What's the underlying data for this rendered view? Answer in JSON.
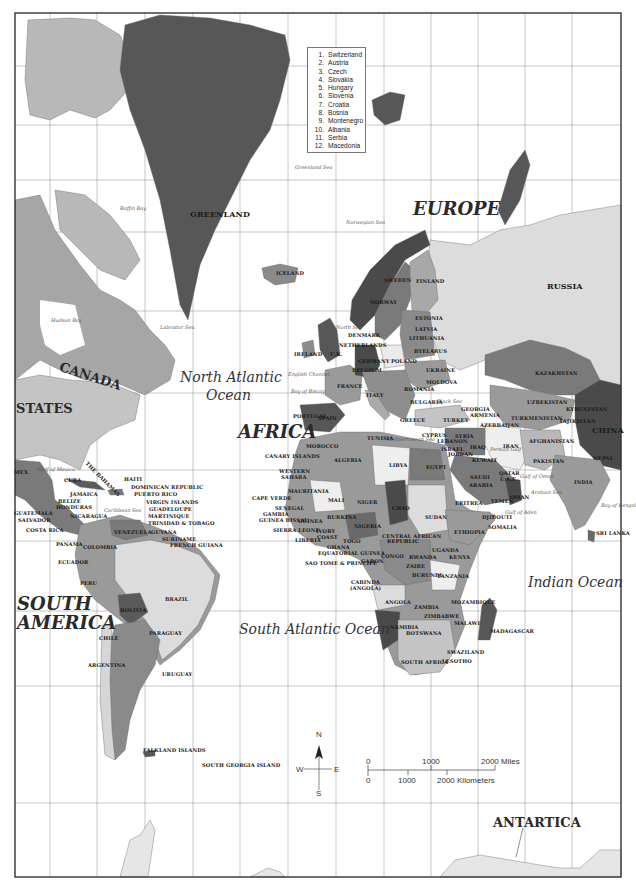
{
  "map": {
    "border": {
      "x": 15,
      "y": 13,
      "w": 606,
      "h": 864
    },
    "grid_x": [
      50,
      97,
      145,
      193,
      240,
      288,
      336,
      384,
      431,
      478,
      525,
      572
    ],
    "grid_y": [
      66,
      125,
      180,
      232,
      311,
      393,
      470,
      541,
      611,
      686,
      803
    ],
    "colors": {
      "dark": "#4a4a4a",
      "mid": "#7a7a7a",
      "midlight": "#9a9a9a",
      "light": "#c4c4c4",
      "pale": "#dcdcdc",
      "grid": "#9e9e9e",
      "border": "#333333"
    }
  },
  "legend": {
    "items": [
      {
        "num": "1.",
        "name": "Switzerland"
      },
      {
        "num": "2.",
        "name": "Austria"
      },
      {
        "num": "3.",
        "name": "Czech"
      },
      {
        "num": "4.",
        "name": "Slovakia"
      },
      {
        "num": "5.",
        "name": "Hungary"
      },
      {
        "num": "6.",
        "name": "Slovenia"
      },
      {
        "num": "7.",
        "name": "Croatia"
      },
      {
        "num": "8.",
        "name": "Bosnia"
      },
      {
        "num": "9.",
        "name": "Montenegro"
      },
      {
        "num": "10.",
        "name": "Albania"
      },
      {
        "num": "11.",
        "name": "Serbia"
      },
      {
        "num": "12.",
        "name": "Macedonia"
      }
    ]
  },
  "continents": [
    {
      "text": "EUROPE",
      "x": 413,
      "y": 200
    },
    {
      "text": "AFRICA",
      "x": 238,
      "y": 423
    },
    {
      "text": "SOUTH",
      "x": 17,
      "y": 595
    },
    {
      "text": "AMERICA",
      "x": 17,
      "y": 614
    }
  ],
  "upright_regions": [
    {
      "text": "ANTARTICA",
      "x": 493,
      "y": 816
    },
    {
      "text": "CANADA",
      "x": 62,
      "y": 360,
      "rotate": 18
    },
    {
      "text": "STATES",
      "x": 16,
      "y": 402
    }
  ],
  "oceans": [
    {
      "text": "North Atlantic",
      "x": 180,
      "y": 370
    },
    {
      "text": "Ocean",
      "x": 206,
      "y": 388
    },
    {
      "text": "South Atlantic Ocean",
      "x": 239,
      "y": 622
    },
    {
      "text": "Indian Ocean",
      "x": 528,
      "y": 575
    }
  ],
  "seas": [
    {
      "text": "Greenland Sea",
      "x": 295,
      "y": 165
    },
    {
      "text": "Baffin Bay",
      "x": 120,
      "y": 206
    },
    {
      "text": "Norwegian Sea",
      "x": 346,
      "y": 220
    },
    {
      "text": "Hudson Bay",
      "x": 51,
      "y": 318
    },
    {
      "text": "Labrador Sea",
      "x": 160,
      "y": 325
    },
    {
      "text": "North Sea",
      "x": 336,
      "y": 325
    },
    {
      "text": "English Channel",
      "x": 288,
      "y": 372
    },
    {
      "text": "Bay of Biscay",
      "x": 291,
      "y": 389
    },
    {
      "text": "Black Sea",
      "x": 437,
      "y": 399
    },
    {
      "text": "Mediterranean Sea",
      "x": 386,
      "y": 437
    },
    {
      "text": "Persian Gulf",
      "x": 490,
      "y": 447
    },
    {
      "text": "Gulf of Oman",
      "x": 520,
      "y": 474
    },
    {
      "text": "Arabian Sea",
      "x": 531,
      "y": 490
    },
    {
      "text": "Gulf of Aden",
      "x": 505,
      "y": 510
    },
    {
      "text": "Bay of Bengal",
      "x": 601,
      "y": 503
    },
    {
      "text": "Gulf of Mexico",
      "x": 38,
      "y": 467
    },
    {
      "text": "Caribbean Sea",
      "x": 104,
      "y": 508
    }
  ],
  "countries": [
    {
      "text": "GREENLAND",
      "x": 190,
      "y": 210,
      "big": true
    },
    {
      "text": "ICELAND",
      "x": 276,
      "y": 271
    },
    {
      "text": "RUSSIA",
      "x": 547,
      "y": 282,
      "big": true
    },
    {
      "text": "SWEDEN",
      "x": 384,
      "y": 278
    },
    {
      "text": "FINLAND",
      "x": 416,
      "y": 279
    },
    {
      "text": "NORWAY",
      "x": 370,
      "y": 300
    },
    {
      "text": "ESTONIA",
      "x": 415,
      "y": 316
    },
    {
      "text": "LATVIA",
      "x": 415,
      "y": 327
    },
    {
      "text": "DENMARK",
      "x": 348,
      "y": 333
    },
    {
      "text": "LITHUANIA",
      "x": 409,
      "y": 336
    },
    {
      "text": "IRELAND",
      "x": 294,
      "y": 352
    },
    {
      "text": "U.K.",
      "x": 330,
      "y": 352
    },
    {
      "text": "NETHERLANDS",
      "x": 339,
      "y": 343
    },
    {
      "text": "BYELARUS",
      "x": 414,
      "y": 349
    },
    {
      "text": "GERMANY",
      "x": 358,
      "y": 359
    },
    {
      "text": "POLAND",
      "x": 391,
      "y": 359
    },
    {
      "text": "BELGIUM",
      "x": 352,
      "y": 368
    },
    {
      "text": "UKRAINE",
      "x": 426,
      "y": 368
    },
    {
      "text": "FRANCE",
      "x": 337,
      "y": 384
    },
    {
      "text": "MOLDOVA",
      "x": 426,
      "y": 380
    },
    {
      "text": "ROMANIA",
      "x": 404,
      "y": 387
    },
    {
      "text": "ITALY",
      "x": 366,
      "y": 393
    },
    {
      "text": "BULGARIA",
      "x": 410,
      "y": 400
    },
    {
      "text": "PORTUGAL",
      "x": 293,
      "y": 414
    },
    {
      "text": "SPAIN",
      "x": 318,
      "y": 416
    },
    {
      "text": "GREECE",
      "x": 400,
      "y": 418
    },
    {
      "text": "GEORGIA",
      "x": 461,
      "y": 407
    },
    {
      "text": "ARMENIA",
      "x": 470,
      "y": 413
    },
    {
      "text": "TURKEY",
      "x": 443,
      "y": 418
    },
    {
      "text": "AZERBAIJAN",
      "x": 480,
      "y": 423
    },
    {
      "text": "KAZAKHSTAN",
      "x": 535,
      "y": 371
    },
    {
      "text": "UZBEKISTAN",
      "x": 527,
      "y": 400
    },
    {
      "text": "KYRGYZSTAN",
      "x": 566,
      "y": 407
    },
    {
      "text": "TURKMENISTAN",
      "x": 511,
      "y": 416
    },
    {
      "text": "TAJIKISTAN",
      "x": 559,
      "y": 419
    },
    {
      "text": "CHINA",
      "x": 592,
      "y": 426,
      "big": true
    },
    {
      "text": "CYPRUS",
      "x": 422,
      "y": 433
    },
    {
      "text": "SYRIA",
      "x": 455,
      "y": 434
    },
    {
      "text": "LEBANON",
      "x": 437,
      "y": 439
    },
    {
      "text": "IRAQ",
      "x": 470,
      "y": 445
    },
    {
      "text": "ISRAEL",
      "x": 441,
      "y": 447
    },
    {
      "text": "JORDAN",
      "x": 448,
      "y": 452
    },
    {
      "text": "IRAN",
      "x": 503,
      "y": 444
    },
    {
      "text": "AFGHANISTAN",
      "x": 529,
      "y": 439
    },
    {
      "text": "PAKISTAN",
      "x": 533,
      "y": 459
    },
    {
      "text": "NEPAL",
      "x": 593,
      "y": 456
    },
    {
      "text": "KUWAIT",
      "x": 472,
      "y": 458
    },
    {
      "text": "QATAR",
      "x": 499,
      "y": 471
    },
    {
      "text": "U.A.E.",
      "x": 500,
      "y": 477
    },
    {
      "text": "INDIA",
      "x": 574,
      "y": 480
    },
    {
      "text": "OMAN",
      "x": 510,
      "y": 495
    },
    {
      "text": "SAUDI",
      "x": 470,
      "y": 475
    },
    {
      "text": "ARABIA",
      "x": 469,
      "y": 483
    },
    {
      "text": "YEMEN",
      "x": 491,
      "y": 499
    },
    {
      "text": "ERITREA",
      "x": 455,
      "y": 501
    },
    {
      "text": "DJIBOUTI",
      "x": 482,
      "y": 515
    },
    {
      "text": "SOMALIA",
      "x": 488,
      "y": 525
    },
    {
      "text": "ETHIOPIA",
      "x": 454,
      "y": 530
    },
    {
      "text": "SRI LANKA",
      "x": 596,
      "y": 531
    },
    {
      "text": "KENYA",
      "x": 449,
      "y": 555
    },
    {
      "text": "UGANDA",
      "x": 432,
      "y": 548
    },
    {
      "text": "RWANDA",
      "x": 409,
      "y": 555
    },
    {
      "text": "TANZANIA",
      "x": 437,
      "y": 574
    },
    {
      "text": "BURUNDI",
      "x": 412,
      "y": 573
    },
    {
      "text": "ZAIRE",
      "x": 406,
      "y": 564
    },
    {
      "text": "MOROCCO",
      "x": 306,
      "y": 444
    },
    {
      "text": "TUNISIA",
      "x": 367,
      "y": 436
    },
    {
      "text": "ALGERIA",
      "x": 334,
      "y": 458
    },
    {
      "text": "LIBYA",
      "x": 389,
      "y": 463
    },
    {
      "text": "EGYPT",
      "x": 426,
      "y": 465
    },
    {
      "text": "CANARY ISLANDS",
      "x": 265,
      "y": 454
    },
    {
      "text": "WESTERN",
      "x": 279,
      "y": 469
    },
    {
      "text": "SAHARA",
      "x": 281,
      "y": 475
    },
    {
      "text": "MAURITANIA",
      "x": 288,
      "y": 489
    },
    {
      "text": "MALI",
      "x": 328,
      "y": 498
    },
    {
      "text": "NIGER",
      "x": 357,
      "y": 500
    },
    {
      "text": "CHAD",
      "x": 392,
      "y": 506
    },
    {
      "text": "SUDAN",
      "x": 425,
      "y": 515
    },
    {
      "text": "CAPE VERDE",
      "x": 252,
      "y": 496
    },
    {
      "text": "SENEGAL",
      "x": 275,
      "y": 506
    },
    {
      "text": "GAMBIA",
      "x": 263,
      "y": 512
    },
    {
      "text": "GUINEA BISSAU",
      "x": 259,
      "y": 518
    },
    {
      "text": "GUINEA",
      "x": 298,
      "y": 519
    },
    {
      "text": "BURKINA",
      "x": 327,
      "y": 515
    },
    {
      "text": "NIGERIA",
      "x": 354,
      "y": 524
    },
    {
      "text": "SIERRA LEONE",
      "x": 273,
      "y": 528
    },
    {
      "text": "IVORY",
      "x": 316,
      "y": 529
    },
    {
      "text": "COAST",
      "x": 317,
      "y": 535
    },
    {
      "text": "CENTRAL AFRICAN",
      "x": 382,
      "y": 534
    },
    {
      "text": "REPUBLIC",
      "x": 387,
      "y": 539
    },
    {
      "text": "LIBERIA",
      "x": 295,
      "y": 538
    },
    {
      "text": "TOGO",
      "x": 343,
      "y": 539
    },
    {
      "text": "GHANA",
      "x": 327,
      "y": 545
    },
    {
      "text": "EQUATORIAL GUINEA",
      "x": 318,
      "y": 551
    },
    {
      "text": "SAO TOME & PRINCIPE",
      "x": 305,
      "y": 561
    },
    {
      "text": "GABON",
      "x": 361,
      "y": 559
    },
    {
      "text": "CONGO",
      "x": 381,
      "y": 554
    },
    {
      "text": "CABINDA",
      "x": 351,
      "y": 580
    },
    {
      "text": "(ANGOLA)",
      "x": 350,
      "y": 586
    },
    {
      "text": "ANGOLA",
      "x": 385,
      "y": 600
    },
    {
      "text": "ZAMBIA",
      "x": 414,
      "y": 605
    },
    {
      "text": "MOZAMBIQUE",
      "x": 451,
      "y": 600
    },
    {
      "text": "ZIMBABWE",
      "x": 424,
      "y": 614
    },
    {
      "text": "NAMIBIA",
      "x": 390,
      "y": 625
    },
    {
      "text": "MALAWI",
      "x": 454,
      "y": 621
    },
    {
      "text": "BOTSWANA",
      "x": 406,
      "y": 631
    },
    {
      "text": "MADAGASCAR",
      "x": 490,
      "y": 629
    },
    {
      "text": "SWAZILAND",
      "x": 447,
      "y": 650
    },
    {
      "text": "SOUTH AFRICA",
      "x": 401,
      "y": 660
    },
    {
      "text": "LESOTHO",
      "x": 442,
      "y": 659
    },
    {
      "text": "THE BAHAMAS",
      "x": 88,
      "y": 461,
      "rotate": 45
    },
    {
      "text": "CUBA",
      "x": 64,
      "y": 478
    },
    {
      "text": "HAITI",
      "x": 124,
      "y": 477
    },
    {
      "text": "DOMINICAN REPUBLIC",
      "x": 131,
      "y": 485
    },
    {
      "text": "JAMAICA",
      "x": 70,
      "y": 492
    },
    {
      "text": "PUERTO RICO",
      "x": 134,
      "y": 492
    },
    {
      "text": "BELIZE",
      "x": 58,
      "y": 499
    },
    {
      "text": "VIRGIN ISLANDS",
      "x": 146,
      "y": 500
    },
    {
      "text": "HONDURAS",
      "x": 56,
      "y": 505
    },
    {
      "text": "GUADELOUPE",
      "x": 149,
      "y": 507
    },
    {
      "text": "GUATEMALA",
      "x": 14,
      "y": 511
    },
    {
      "text": "MARTINIQUE",
      "x": 148,
      "y": 514
    },
    {
      "text": "NICARAGUA",
      "x": 70,
      "y": 514
    },
    {
      "text": "TRINIDAD & TOBAGO",
      "x": 148,
      "y": 521
    },
    {
      "text": "SALVADOR",
      "x": 18,
      "y": 518
    },
    {
      "text": "COSTA RICA",
      "x": 26,
      "y": 528
    },
    {
      "text": "GUYANA",
      "x": 151,
      "y": 530
    },
    {
      "text": "VENEZUELA",
      "x": 114,
      "y": 530
    },
    {
      "text": "SURINAME",
      "x": 162,
      "y": 537
    },
    {
      "text": "FRENCH GUIANA",
      "x": 170,
      "y": 543
    },
    {
      "text": "PANAMA",
      "x": 56,
      "y": 542
    },
    {
      "text": "COLOMBIA",
      "x": 83,
      "y": 545
    },
    {
      "text": "ECUADOR",
      "x": 58,
      "y": 560
    },
    {
      "text": "PERU",
      "x": 80,
      "y": 581
    },
    {
      "text": "BRAZIL",
      "x": 165,
      "y": 597
    },
    {
      "text": "BOLIVIA",
      "x": 120,
      "y": 608
    },
    {
      "text": "PARAGUAY",
      "x": 149,
      "y": 631
    },
    {
      "text": "CHILE",
      "x": 99,
      "y": 636
    },
    {
      "text": "ARGENTINA",
      "x": 88,
      "y": 663
    },
    {
      "text": "URUGUAY",
      "x": 162,
      "y": 672
    },
    {
      "text": "FALKLAND ISLANDS",
      "x": 143,
      "y": 748
    },
    {
      "text": "SOUTH GEORGIA ISLAND",
      "x": 202,
      "y": 763
    },
    {
      "text": "MEX",
      "x": 14,
      "y": 470
    }
  ],
  "compass": {
    "N": "N",
    "S": "S",
    "E": "E",
    "W": "W"
  },
  "scale": {
    "miles": {
      "zero": "0",
      "mid": "1000",
      "end": "2000 Miles"
    },
    "km": {
      "zero": "0",
      "mid": "1000",
      "end": "2000 Kilometers"
    }
  }
}
